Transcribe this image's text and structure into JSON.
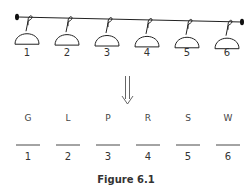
{
  "figure": {
    "caption": "Figure 6.1",
    "hangers": [
      {
        "label": "1"
      },
      {
        "label": "2"
      },
      {
        "label": "3"
      },
      {
        "label": "4"
      },
      {
        "label": "5"
      },
      {
        "label": "6"
      }
    ],
    "slots": [
      {
        "letter": "G",
        "position": "1"
      },
      {
        "letter": "L",
        "position": "2"
      },
      {
        "letter": "P",
        "position": "3"
      },
      {
        "letter": "R",
        "position": "4"
      },
      {
        "letter": "S",
        "position": "5"
      },
      {
        "letter": "W",
        "position": "6"
      }
    ],
    "arrow_icon": "double-down-arrow",
    "colors": {
      "ink": "#222222",
      "background": "#ffffff"
    }
  }
}
